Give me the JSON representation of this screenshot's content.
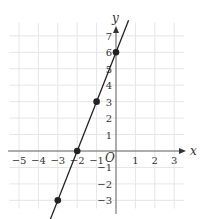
{
  "chart_data": {
    "type": "line",
    "title": "",
    "xlabel": "x",
    "ylabel": "y",
    "origin_label": "O",
    "xlim": [
      -5,
      3
    ],
    "ylim": [
      -3,
      7
    ],
    "x_ticks": [
      -5,
      -4,
      -3,
      -2,
      -1,
      1,
      2,
      3
    ],
    "y_ticks": [
      -3,
      -2,
      -1,
      1,
      2,
      3,
      4,
      5,
      6,
      7
    ],
    "grid": true,
    "series": [
      {
        "name": "y = 3x + 6",
        "points": [
          {
            "x": -3,
            "y": -3
          },
          {
            "x": -2,
            "y": 0
          },
          {
            "x": -1,
            "y": 3
          },
          {
            "x": 0,
            "y": 6
          }
        ],
        "line_extends": true
      }
    ],
    "colors": {
      "line": "#222222",
      "grid": "#e6e6e6",
      "axis": "#666666",
      "text": "#333333"
    }
  }
}
